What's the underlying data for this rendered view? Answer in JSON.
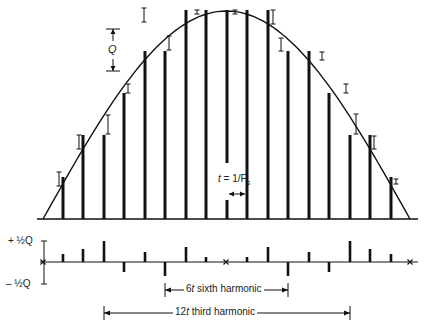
{
  "diagram": {
    "colors": {
      "ink": "#111111",
      "background": "#ffffff"
    },
    "waveform": {
      "baseline_y": 219,
      "x_start": 43,
      "x_end": 410,
      "peak_y": 11
    },
    "samples": [
      {
        "x": 63,
        "top": 177,
        "error": 4
      },
      {
        "x": 83,
        "top": 135,
        "error": 8
      },
      {
        "x": 104,
        "top": 135,
        "error": 12
      },
      {
        "x": 124,
        "top": 93,
        "error": 22
      },
      {
        "x": 145,
        "top": 51,
        "error": -8
      },
      {
        "x": 165,
        "top": 51,
        "error": 6
      },
      {
        "x": 186,
        "top": 10,
        "error": 14
      },
      {
        "x": 206,
        "top": 10,
        "error": 4
      },
      {
        "x": 227,
        "top": 10,
        "error": 0,
        "gap": [
          163,
          200
        ]
      },
      {
        "x": 247,
        "top": 10,
        "error": 4
      },
      {
        "x": 268,
        "top": 10,
        "error": 14
      },
      {
        "x": 288,
        "top": 51,
        "error": -12
      },
      {
        "x": 309,
        "top": 51,
        "error": 6
      },
      {
        "x": 329,
        "top": 93,
        "error": -8
      },
      {
        "x": 350,
        "top": 135,
        "error": 22
      },
      {
        "x": 370,
        "top": 135,
        "error": 12
      },
      {
        "x": 391,
        "top": 177,
        "error": 8
      }
    ],
    "error_bars": [
      {
        "x": 59,
        "y1": 172,
        "y2": 186
      },
      {
        "x": 79,
        "y1": 135,
        "y2": 149
      },
      {
        "x": 108,
        "y1": 115,
        "y2": 134
      },
      {
        "x": 128,
        "y1": 84,
        "y2": 93
      },
      {
        "x": 169,
        "y1": 36,
        "y2": 50
      },
      {
        "x": 144,
        "y1": 8,
        "y2": 22
      },
      {
        "x": 197,
        "y1": 10,
        "y2": 14
      },
      {
        "x": 235,
        "y1": 10,
        "y2": 14
      },
      {
        "x": 273,
        "y1": 10,
        "y2": 24
      },
      {
        "x": 281,
        "y1": 38,
        "y2": 51
      },
      {
        "x": 322,
        "y1": 52,
        "y2": 60
      },
      {
        "x": 346,
        "y1": 84,
        "y2": 93
      },
      {
        "x": 356,
        "y1": 114,
        "y2": 134
      },
      {
        "x": 374,
        "y1": 136,
        "y2": 149
      },
      {
        "x": 396,
        "y1": 179,
        "y2": 184
      }
    ],
    "q_marker": {
      "x": 113,
      "top": 29,
      "bottom": 71,
      "label": "Q"
    },
    "sample_interval": {
      "label_t": "t",
      "label_rest": " = 1/F",
      "label_sub": "s",
      "x1": 227,
      "x2": 247,
      "arrow_y": 194
    },
    "error_plot": {
      "axis_y": 262,
      "x_start": 40,
      "x_end": 418,
      "plus_label": "+ ½Q",
      "minus_label": "– ½Q",
      "plus_y": 241,
      "minus_y": 284,
      "zero_crosses": [
        43,
        226,
        410
      ],
      "bars": [
        {
          "x": 63,
          "h": 8
        },
        {
          "x": 83,
          "h": 13
        },
        {
          "x": 104,
          "h": 21
        },
        {
          "x": 124,
          "h": -10
        },
        {
          "x": 145,
          "h": 10
        },
        {
          "x": 165,
          "h": -14
        },
        {
          "x": 186,
          "h": 15
        },
        {
          "x": 206,
          "h": 5
        },
        {
          "x": 247,
          "h": 5
        },
        {
          "x": 268,
          "h": 15
        },
        {
          "x": 288,
          "h": -14
        },
        {
          "x": 309,
          "h": 10
        },
        {
          "x": 329,
          "h": -10
        },
        {
          "x": 350,
          "h": 21
        },
        {
          "x": 370,
          "h": 13
        },
        {
          "x": 391,
          "h": 8
        }
      ]
    },
    "harmonics": [
      {
        "label": "6t sixth harmonic",
        "label_t": "6",
        "label_i": "t",
        "label_rest": " sixth harmonic",
        "x1": 165,
        "x2": 288,
        "y": 290
      },
      {
        "label": "12t third harmonic",
        "label_t": "12",
        "label_i": "t",
        "label_rest": " third harmonic",
        "x1": 104,
        "x2": 350,
        "y": 313
      }
    ]
  }
}
